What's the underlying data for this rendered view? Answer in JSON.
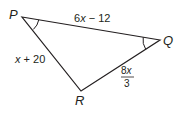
{
  "diagram": {
    "type": "triangle",
    "vertices": {
      "P": {
        "label": "P",
        "x": 22,
        "y": 17
      },
      "Q": {
        "label": "Q",
        "x": 160,
        "y": 40
      },
      "R": {
        "label": "R",
        "x": 81,
        "y": 91
      }
    },
    "sides": {
      "PQ": {
        "expr_num": "6",
        "expr_var": "x",
        "expr_rest": " − 12",
        "full": "6x − 12"
      },
      "PR": {
        "expr_var": "x",
        "expr_rest": " + 20",
        "full": "x + 20"
      },
      "QR": {
        "numerator_num": "8",
        "numerator_var": "x",
        "denominator": "3",
        "full": "8x/3"
      }
    },
    "angle_marks": [
      "P",
      "Q"
    ],
    "stroke_color": "#231f20"
  }
}
